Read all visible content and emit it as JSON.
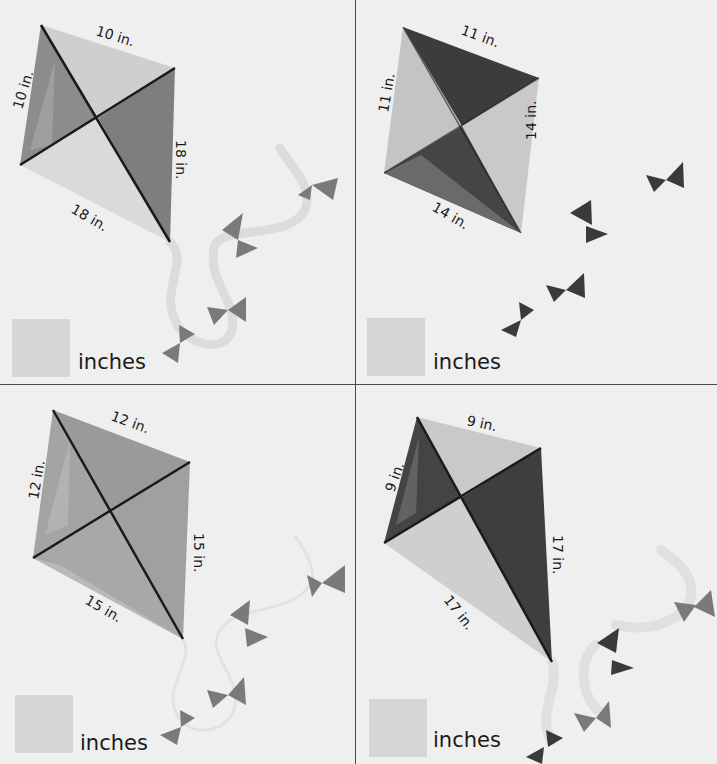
{
  "worksheet": {
    "colors": {
      "background": "#efefef",
      "divider": "#4a4a4a",
      "answer_box": "#d6d6d6",
      "diagonal": "#1a1a1a",
      "ribbon": "#dcdcdc"
    },
    "kites": [
      {
        "id": "kite-top-left",
        "short_side_labels": [
          "10 in.",
          "10 in."
        ],
        "long_side_labels": [
          "18 in.",
          "18 in."
        ],
        "short_side": 10,
        "long_side": 18,
        "unit_label": "inches",
        "answer": ""
      },
      {
        "id": "kite-top-right",
        "short_side_labels": [
          "11 in.",
          "11 in."
        ],
        "long_side_labels": [
          "14 in.",
          "14 in."
        ],
        "short_side": 11,
        "long_side": 14,
        "unit_label": "inches",
        "answer": ""
      },
      {
        "id": "kite-bottom-left",
        "short_side_labels": [
          "12 in.",
          "12 in."
        ],
        "long_side_labels": [
          "15 in.",
          "15 in."
        ],
        "short_side": 12,
        "long_side": 15,
        "unit_label": "inches",
        "answer": ""
      },
      {
        "id": "kite-bottom-right",
        "short_side_labels": [
          "9 in.",
          "9 in."
        ],
        "long_side_labels": [
          "17 in.",
          "17 in."
        ],
        "short_side": 9,
        "long_side": 17,
        "unit_label": "inches",
        "answer": ""
      }
    ]
  }
}
